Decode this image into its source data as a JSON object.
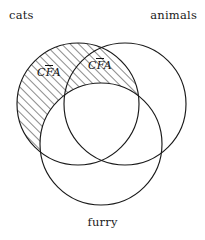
{
  "figure": {
    "kind": "three-set-venn-diagram",
    "width": 205,
    "height": 240,
    "background_color": "#ffffff",
    "stroke_color": "#1a1a1a",
    "hatch_color": "#1a1a1a"
  },
  "sets": {
    "cats": {
      "label": "cats",
      "cx": 78,
      "cy": 104,
      "r": 61
    },
    "animals": {
      "label": "animals",
      "cx": 125,
      "cy": 104,
      "r": 61
    },
    "furry": {
      "label": "furry",
      "cx": 101,
      "cy": 144,
      "r": 61
    }
  },
  "region_labels": [
    {
      "name": "region-label-left",
      "prefix": "C",
      "barred": "F",
      "suffix": "A",
      "full_text": "CFA"
    },
    {
      "name": "region-label-right",
      "prefix": "C",
      "barred": "F",
      "suffix": "A",
      "full_text": "CFA"
    }
  ],
  "shading": {
    "description": "cats circle excluding furry circle, including the cats-animals lens above furry",
    "style": "diagonal-hatch",
    "angle_degrees": 45,
    "spacing_px": 6,
    "line_width_px": 1
  }
}
